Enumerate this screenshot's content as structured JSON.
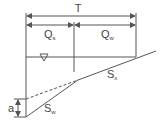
{
  "diagram": {
    "labels": {
      "total_width": "T",
      "q_left": "Q",
      "q_left_sub": "s",
      "q_right": "Q",
      "q_right_sub": "w",
      "water_surface": "∇",
      "slope_street": "S",
      "slope_street_sub": "x",
      "slope_gutter": "S",
      "slope_gutter_sub": "w",
      "depression": "a"
    },
    "colors": {
      "line": "#555555",
      "text": "#444444",
      "background": "#ffffff"
    }
  }
}
